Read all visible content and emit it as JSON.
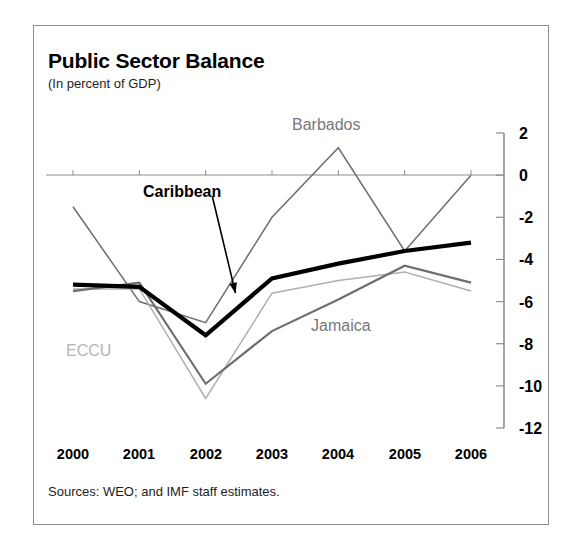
{
  "figure": {
    "title": "Public Sector Balance",
    "subtitle": "(In percent of GDP)",
    "source": "Sources: WEO; and IMF staff estimates."
  },
  "labels": {
    "barbados": "Barbados",
    "jamaica": "Jamaica",
    "eccu": "ECCU",
    "caribbean": "Caribbean"
  },
  "colors": {
    "caribbean": "#000000",
    "barbados": "#6e6e6e",
    "jamaica": "#6e6e6e",
    "eccu": "#b0b0b0",
    "axis": "#8d8d8d",
    "frame": "#8d8d8d"
  },
  "axis": {
    "y_ticks": [
      "2",
      "0",
      "-2",
      "-4",
      "-6",
      "-8",
      "-10",
      "-12"
    ],
    "x_ticks": [
      "2000",
      "2001",
      "2002",
      "2003",
      "2004",
      "2005",
      "2006"
    ]
  },
  "chart_data": {
    "type": "line",
    "title": "Public Sector Balance",
    "subtitle": "(In percent of GDP)",
    "xlabel": "",
    "ylabel": "In percent of GDP",
    "x": [
      2000,
      2001,
      2002,
      2003,
      2004,
      2005,
      2006
    ],
    "categories": [
      "2000",
      "2001",
      "2002",
      "2003",
      "2004",
      "2005",
      "2006"
    ],
    "ylim": [
      -12,
      2
    ],
    "xlim": [
      2000,
      2006
    ],
    "yticks": [
      2,
      0,
      -2,
      -4,
      -6,
      -8,
      -10,
      -12
    ],
    "grid": false,
    "legend": "inline-annotations",
    "series": [
      {
        "name": "Caribbean",
        "color": "#000000",
        "linewidth": "thick",
        "values": [
          -5.2,
          -5.3,
          -7.6,
          -4.9,
          -4.2,
          -3.6,
          -3.2
        ]
      },
      {
        "name": "Barbados",
        "color": "#6e6e6e",
        "linewidth": "thin",
        "values": [
          -1.5,
          -6.0,
          -7.0,
          -2.0,
          1.3,
          -3.6,
          0.0
        ]
      },
      {
        "name": "Jamaica",
        "color": "#6e6e6e",
        "linewidth": "medium",
        "values": [
          -5.5,
          -5.1,
          -9.9,
          -7.4,
          -5.9,
          -4.3,
          -5.1
        ]
      },
      {
        "name": "ECCU",
        "color": "#b0b0b0",
        "linewidth": "thin",
        "values": [
          -5.4,
          -5.4,
          -10.6,
          -5.6,
          -5.0,
          -4.6,
          -5.5
        ]
      }
    ],
    "annotations": [
      {
        "text": "Caribbean",
        "x": 2002.1,
        "y": -1.0,
        "arrow_to": {
          "x": 2002.45,
          "y": -5.6
        }
      },
      {
        "text": "Barbados",
        "x": 2003.6,
        "y": 2.3
      },
      {
        "text": "Jamaica",
        "x": 2003.3,
        "y": -7.6
      },
      {
        "text": "ECCU",
        "x": 2000.3,
        "y": -8.1
      }
    ]
  }
}
